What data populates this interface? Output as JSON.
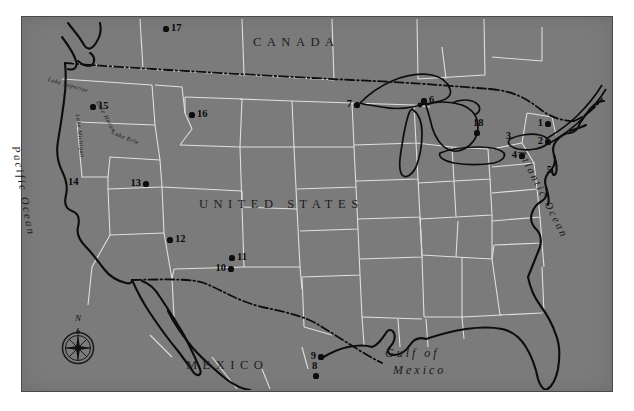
{
  "map": {
    "title": "Reference map of the United States",
    "background_color": "#7b7b7b",
    "border_color": "#4a4a4a",
    "state_border_color": "#e8e8e8",
    "coastline_color": "#0d0d0d",
    "marker_color": "#0d0d0d",
    "frame": {
      "x": 21,
      "y": 16,
      "width": 592,
      "height": 376
    }
  },
  "country_labels": [
    {
      "text": "CANADA",
      "x": 253,
      "y": 35
    },
    {
      "text": "UNITED STATES",
      "x": 199,
      "y": 197
    },
    {
      "text": "MEXICO",
      "x": 186,
      "y": 358
    }
  ],
  "ocean_labels": [
    {
      "text": "Pacific Ocean",
      "x": 22,
      "y": 145
    },
    {
      "text": "Atlantic Ocean",
      "x": 527,
      "y": 148
    }
  ],
  "gulf_label": {
    "line1": "Gulf of",
    "line2": "Mexico",
    "x": 385,
    "y": 351
  },
  "lake_labels": [
    {
      "text": "Lake Superior",
      "x": 383,
      "y": 78,
      "rotate": 16
    },
    {
      "text": "Lake Huron",
      "x": 432,
      "y": 100,
      "rotate": 62
    },
    {
      "text": "Lake Michigan",
      "x": 412,
      "y": 113,
      "rotate": 84
    },
    {
      "text": "Lake Erie",
      "x": 446,
      "y": 131,
      "rotate": 22
    }
  ],
  "compass": {
    "label": "N",
    "x": 78,
    "y": 348
  },
  "markers": [
    {
      "id": "1",
      "x": 548,
      "y": 124,
      "label_side": "left"
    },
    {
      "id": "2",
      "x": 542,
      "y": 142,
      "label_side": "left"
    },
    {
      "id": "3",
      "x": 510,
      "y": 137,
      "label_side": "right"
    },
    {
      "id": "4",
      "x": 522,
      "y": 156,
      "label_side": "left"
    },
    {
      "id": "5",
      "x": 551,
      "y": 171,
      "label_side": "none"
    },
    {
      "id": "6",
      "x": 425,
      "y": 100,
      "label_side": "right"
    },
    {
      "id": "7",
      "x": 357,
      "y": 105,
      "label_side": "left"
    },
    {
      "id": "8",
      "x": 316,
      "y": 375,
      "label_side": "top"
    },
    {
      "id": "9",
      "x": 318,
      "y": 357,
      "label_side": "right"
    },
    {
      "id": "10",
      "x": 231,
      "y": 269,
      "label_side": "left"
    },
    {
      "id": "11",
      "x": 232,
      "y": 258,
      "label_side": "right"
    },
    {
      "id": "12",
      "x": 170,
      "y": 240,
      "label_side": "right"
    },
    {
      "id": "13",
      "x": 146,
      "y": 184,
      "label_side": "left"
    },
    {
      "id": "14",
      "x": 72,
      "y": 187,
      "label_side": "top"
    },
    {
      "id": "15",
      "x": 93,
      "y": 107,
      "label_side": "right"
    },
    {
      "id": "16",
      "x": 192,
      "y": 115,
      "label_side": "right"
    },
    {
      "id": "17",
      "x": 166,
      "y": 28,
      "label_side": "right"
    },
    {
      "id": "18",
      "x": 477,
      "y": 128,
      "label_side": "top"
    }
  ]
}
